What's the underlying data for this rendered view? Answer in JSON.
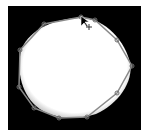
{
  "canvas": {
    "background": "#000000",
    "mask_color": "#ffffff",
    "outline_color": "#8a8a8a",
    "vertex_color": "#6e6e6e"
  },
  "annotation": {
    "shape": "polygon",
    "vertices": [
      [
        81,
        17
      ],
      [
        95,
        20
      ],
      [
        117,
        40
      ],
      [
        132,
        66
      ],
      [
        117,
        93
      ],
      [
        87,
        117
      ],
      [
        59,
        118
      ],
      [
        34,
        108
      ],
      [
        19,
        87
      ],
      [
        20,
        50
      ],
      [
        44,
        24
      ]
    ]
  },
  "cursor": {
    "type": "move-crosshair",
    "x": 84,
    "y": 22
  }
}
